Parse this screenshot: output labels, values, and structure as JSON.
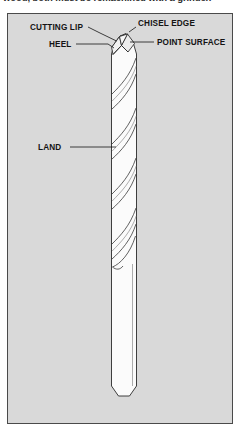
{
  "caption": {
    "text": "wood, both must be remachined with a grinder."
  },
  "figure": {
    "name": "twist-drill-point-geometry-diagram",
    "panel": {
      "background_color": "#d9d9d9",
      "border_color": "#4a4a4a"
    },
    "drill": {
      "body_fill": "#fbfbfb",
      "outline_color": "#2a2a2a",
      "flute_color": "#3a3a3a"
    },
    "callouts": [
      {
        "id": "cutting-lip",
        "label": "CUTTING LIP",
        "side": "left"
      },
      {
        "id": "chisel-edge",
        "label": "CHISEL EDGE",
        "side": "right"
      },
      {
        "id": "heel",
        "label": "HEEL",
        "side": "left"
      },
      {
        "id": "point-surface",
        "label": "POINT SURFACE",
        "side": "right"
      },
      {
        "id": "land",
        "label": "LAND",
        "side": "left"
      }
    ]
  }
}
